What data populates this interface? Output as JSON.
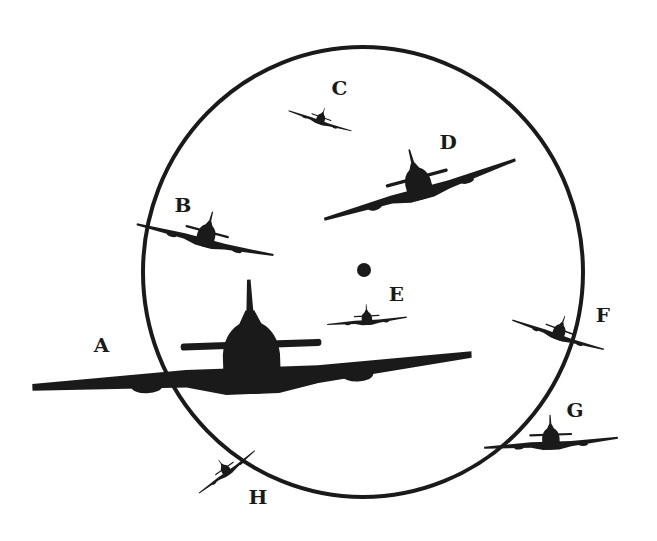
{
  "diagram": {
    "type": "gunsight-ring-target-positions",
    "colors": {
      "ink": "#1a1a1a",
      "background": "#ffffff"
    },
    "ring": {
      "cx": 363,
      "cy": 272,
      "rx": 220,
      "ry": 225,
      "stroke_width": 4
    },
    "center_dot": {
      "cx": 364,
      "cy": 270,
      "r": 7
    },
    "targets": [
      {
        "label": "A",
        "label_pos": [
          94,
          336
        ],
        "aircraft": {
          "cx": 252,
          "cy": 372,
          "scale": 2.2,
          "rotate": -2
        },
        "description": "large aircraft, overlapping ring left edge"
      },
      {
        "label": "B",
        "label_pos": [
          175,
          196
        ],
        "aircraft": {
          "cx": 205,
          "cy": 240,
          "scale": 0.7,
          "rotate": 15
        },
        "description": "aircraft banking, crossing ring left edge"
      },
      {
        "label": "C",
        "label_pos": [
          332,
          79
        ],
        "aircraft": {
          "cx": 320,
          "cy": 121,
          "scale": 0.33,
          "rotate": 20
        },
        "description": "small aircraft banking inside ring near top"
      },
      {
        "label": "D",
        "label_pos": [
          440,
          133
        ],
        "aircraft": {
          "cx": 420,
          "cy": 190,
          "scale": 1.0,
          "rotate": -15
        },
        "description": "aircraft banking inside ring upper right"
      },
      {
        "label": "E",
        "label_pos": [
          389,
          285
        ],
        "aircraft": {
          "cx": 367,
          "cy": 321,
          "scale": 0.4,
          "rotate": -3
        },
        "description": "small aircraft below center dot"
      },
      {
        "label": "F",
        "label_pos": [
          596,
          306
        ],
        "aircraft": {
          "cx": 558,
          "cy": 335,
          "scale": 0.48,
          "rotate": 20
        },
        "description": "aircraft banking on ring right edge"
      },
      {
        "label": "G",
        "label_pos": [
          567,
          401
        ],
        "aircraft": {
          "cx": 551,
          "cy": 443,
          "scale": 0.67,
          "rotate": -2
        },
        "description": "aircraft outside ring lower right"
      },
      {
        "label": "H",
        "label_pos": [
          249,
          488
        ],
        "aircraft": {
          "cx": 227,
          "cy": 472,
          "scale": 0.35,
          "rotate": -35
        },
        "description": "aircraft steep bank on ring lower left"
      }
    ]
  }
}
